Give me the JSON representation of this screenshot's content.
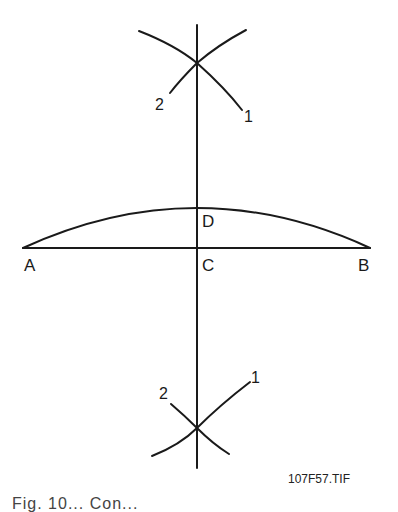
{
  "diagram": {
    "points": {
      "A": "A",
      "B": "B",
      "C": "C",
      "D": "D"
    },
    "arc_labels": {
      "top_left": "2",
      "top_right": "1",
      "bottom_left": "2",
      "bottom_right": "1"
    },
    "figure_id": "107F57.TIF",
    "caption_partial": "Fig. 10... Con..."
  }
}
